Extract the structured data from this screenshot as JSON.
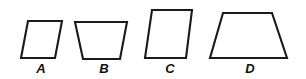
{
  "figure": {
    "background_color": "#ffffff",
    "stroke_color": "#1a1a1a",
    "fill_color": "#ffffff",
    "stroke_width": 2.1,
    "width": 306,
    "height": 79
  },
  "shapes": [
    {
      "id": "shape-a",
      "label": "A",
      "kind": "parallelogram",
      "lean": "left",
      "points": "28,21 62,21 55,58 21,58",
      "label_x": 41,
      "label_y": 62
    },
    {
      "id": "shape-b",
      "label": "B",
      "kind": "parallelogram",
      "lean": "right",
      "points": "75,22 127,22 120,59 83,59",
      "label_x": 104,
      "label_y": 62
    },
    {
      "id": "shape-c",
      "label": "C",
      "kind": "parallelogram",
      "lean": "left",
      "points": "152,10 192,10 186,58 145,58",
      "label_x": 170,
      "label_y": 62
    },
    {
      "id": "shape-d",
      "label": "D",
      "kind": "trapezoid",
      "lean": "none",
      "points": "223,13 272,13 287,58 210,58",
      "label_x": 250,
      "label_y": 62
    }
  ]
}
